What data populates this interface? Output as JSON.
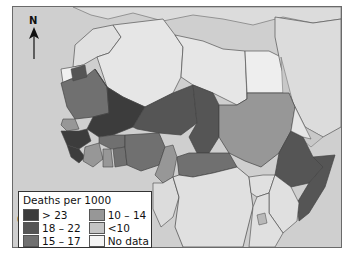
{
  "map": {
    "region": "Africa and Middle East",
    "north_arrow_label": "N",
    "scale_label": "0   km 1000",
    "colors": {
      "sea": "#cfcfcf",
      "land_other": "#d9d9d9",
      "gt23": "#3c3c3c",
      "18_22": "#555555",
      "15_17": "#707070",
      "10_14": "#979797",
      "lt10": "#c4c4c4",
      "no_data": "#e8e8e8",
      "border": "#4a4a4a"
    }
  },
  "legend": {
    "title": "Deaths per 1000",
    "items": [
      {
        "label": "> 23",
        "color": "#3c3c3c"
      },
      {
        "label": "18 – 22",
        "color": "#555555"
      },
      {
        "label": "15 – 17",
        "color": "#707070"
      },
      {
        "label": "10 – 14",
        "color": "#979797"
      },
      {
        "label": "<10",
        "color": "#c4c4c4"
      },
      {
        "label": "No data",
        "color": "#f4f4f4"
      }
    ]
  }
}
